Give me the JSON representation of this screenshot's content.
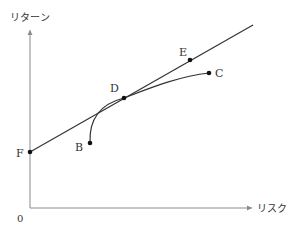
{
  "diagram": {
    "type": "risk-return",
    "y_axis_label": "リターン",
    "x_axis_label": "リスク",
    "origin_label": "0",
    "colors": {
      "axis": "#8a8a8a",
      "line": "#333333",
      "point": "#111111",
      "text": "#333333"
    },
    "points": [
      {
        "label": "F",
        "description": "intercept on return axis"
      },
      {
        "label": "B",
        "description": "start of efficient frontier curve"
      },
      {
        "label": "D",
        "description": "tangency point"
      },
      {
        "label": "E",
        "description": "point on capital market line"
      },
      {
        "label": "C",
        "description": "end of efficient frontier curve"
      }
    ]
  }
}
